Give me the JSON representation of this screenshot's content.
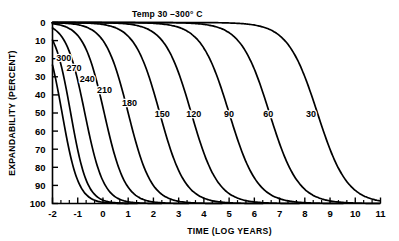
{
  "chart_data": {
    "type": "line",
    "title": "Temp 30 –300° C",
    "xlabel": "TIME (LOG YEARS)",
    "ylabel": "EXPANDABILITY (PERCENT)",
    "xlim": [
      -2,
      11
    ],
    "ylim": [
      0,
      100
    ],
    "y_inverted": true,
    "grid": false,
    "legend": "inline-curve-labels",
    "xticks": [
      -2,
      -1,
      0,
      1,
      2,
      3,
      4,
      5,
      6,
      7,
      8,
      9,
      10,
      11
    ],
    "xtick_labels": [
      "-2",
      "-1",
      "0",
      "1",
      "2",
      "3",
      "4",
      "5",
      "6",
      "7",
      "8",
      "9",
      "10",
      "11"
    ],
    "x_minor_ticks_per_interval": 2,
    "yticks": [
      0,
      10,
      20,
      30,
      40,
      50,
      60,
      70,
      80,
      90,
      100
    ],
    "ytick_labels": [
      "0",
      "10",
      "20",
      "30",
      "40",
      "50",
      "60",
      "70",
      "80",
      "90",
      "100"
    ],
    "series": [
      {
        "name": "300",
        "label": "300",
        "label_x": -1.55,
        "label_y": 21,
        "midpoint_x": -1.62,
        "slope": 1.55,
        "points": [
          {
            "x": -2.0,
            "y": 57.0
          },
          {
            "x": -1.9,
            "y": 68.0
          },
          {
            "x": -1.8,
            "y": 78.0
          },
          {
            "x": -1.7,
            "y": 86.5
          },
          {
            "x": -1.6,
            "y": 92.5
          },
          {
            "x": -1.5,
            "y": 96.2
          },
          {
            "x": -1.4,
            "y": 98.3
          },
          {
            "x": -1.3,
            "y": 99.3
          },
          {
            "x": -1.2,
            "y": 99.8
          },
          {
            "x": -1.1,
            "y": 100.0
          }
        ]
      },
      {
        "name": "270",
        "label": "270",
        "label_x": -1.15,
        "label_y": 27,
        "midpoint_x": -1.28,
        "slope": 1.55,
        "points": [
          {
            "x": -2.0,
            "y": 24.0
          },
          {
            "x": -1.8,
            "y": 40.0
          },
          {
            "x": -1.6,
            "y": 58.0
          },
          {
            "x": -1.4,
            "y": 74.0
          },
          {
            "x": -1.2,
            "y": 86.0
          },
          {
            "x": -1.0,
            "y": 93.5
          },
          {
            "x": -0.8,
            "y": 97.3
          },
          {
            "x": -0.6,
            "y": 99.1
          },
          {
            "x": -0.4,
            "y": 99.8
          },
          {
            "x": -0.2,
            "y": 100.0
          }
        ]
      },
      {
        "name": "240",
        "label": "240",
        "label_x": -0.62,
        "label_y": 33,
        "midpoint_x": -0.72,
        "slope": 1.35,
        "points": [
          {
            "x": -2.0,
            "y": 13.0
          },
          {
            "x": -1.7,
            "y": 23.0
          },
          {
            "x": -1.4,
            "y": 37.0
          },
          {
            "x": -1.1,
            "y": 53.0
          },
          {
            "x": -0.8,
            "y": 69.0
          },
          {
            "x": -0.5,
            "y": 81.5
          },
          {
            "x": -0.2,
            "y": 90.5
          },
          {
            "x": 0.1,
            "y": 95.6
          },
          {
            "x": 0.4,
            "y": 98.2
          },
          {
            "x": 0.7,
            "y": 99.4
          },
          {
            "x": 1.0,
            "y": 99.9
          }
        ]
      },
      {
        "name": "210",
        "label": "210",
        "label_x": 0.06,
        "label_y": 39,
        "midpoint_x": 0.05,
        "slope": 1.22,
        "points": [
          {
            "x": -2.0,
            "y": 7.0
          },
          {
            "x": -1.6,
            "y": 12.0
          },
          {
            "x": -1.2,
            "y": 19.5
          },
          {
            "x": -0.8,
            "y": 30.0
          },
          {
            "x": -0.4,
            "y": 43.0
          },
          {
            "x": 0.0,
            "y": 57.0
          },
          {
            "x": 0.4,
            "y": 70.5
          },
          {
            "x": 0.8,
            "y": 81.5
          },
          {
            "x": 1.2,
            "y": 89.5
          },
          {
            "x": 1.6,
            "y": 94.7
          },
          {
            "x": 2.0,
            "y": 97.6
          },
          {
            "x": 2.4,
            "y": 99.0
          },
          {
            "x": 2.8,
            "y": 99.7
          }
        ]
      },
      {
        "name": "180",
        "label": "180",
        "label_x": 1.05,
        "label_y": 46,
        "midpoint_x": 1.0,
        "slope": 1.1,
        "points": [
          {
            "x": -2.0,
            "y": 3.5
          },
          {
            "x": -1.5,
            "y": 5.8
          },
          {
            "x": -1.0,
            "y": 9.5
          },
          {
            "x": -0.5,
            "y": 15.0
          },
          {
            "x": 0.0,
            "y": 23.0
          },
          {
            "x": 0.5,
            "y": 34.0
          },
          {
            "x": 1.0,
            "y": 47.5
          },
          {
            "x": 1.5,
            "y": 61.5
          },
          {
            "x": 2.0,
            "y": 74.0
          },
          {
            "x": 2.5,
            "y": 84.0
          },
          {
            "x": 3.0,
            "y": 91.0
          },
          {
            "x": 3.5,
            "y": 95.3
          },
          {
            "x": 4.0,
            "y": 97.8
          },
          {
            "x": 4.5,
            "y": 99.1
          }
        ]
      },
      {
        "name": "150",
        "label": "150",
        "label_x": 2.35,
        "label_y": 52,
        "midpoint_x": 2.25,
        "slope": 1.0,
        "points": [
          {
            "x": -2.0,
            "y": 1.5
          },
          {
            "x": -1.2,
            "y": 3.0
          },
          {
            "x": -0.4,
            "y": 6.0
          },
          {
            "x": 0.4,
            "y": 11.5
          },
          {
            "x": 1.0,
            "y": 18.5
          },
          {
            "x": 1.6,
            "y": 29.0
          },
          {
            "x": 2.2,
            "y": 42.5
          },
          {
            "x": 2.8,
            "y": 57.5
          },
          {
            "x": 3.4,
            "y": 71.0
          },
          {
            "x": 4.0,
            "y": 82.0
          },
          {
            "x": 4.6,
            "y": 89.5
          },
          {
            "x": 5.2,
            "y": 94.4
          },
          {
            "x": 5.8,
            "y": 97.2
          },
          {
            "x": 6.4,
            "y": 98.8
          }
        ]
      },
      {
        "name": "120",
        "label": "120",
        "label_x": 3.6,
        "label_y": 52,
        "midpoint_x": 3.5,
        "slope": 0.95,
        "points": [
          {
            "x": -2.0,
            "y": 0.8
          },
          {
            "x": -0.8,
            "y": 2.0
          },
          {
            "x": 0.4,
            "y": 4.5
          },
          {
            "x": 1.4,
            "y": 8.5
          },
          {
            "x": 2.2,
            "y": 14.5
          },
          {
            "x": 2.9,
            "y": 23.5
          },
          {
            "x": 3.5,
            "y": 34.5
          },
          {
            "x": 4.1,
            "y": 48.0
          },
          {
            "x": 4.7,
            "y": 62.0
          },
          {
            "x": 5.3,
            "y": 74.5
          },
          {
            "x": 5.9,
            "y": 84.5
          },
          {
            "x": 6.5,
            "y": 91.0
          },
          {
            "x": 7.1,
            "y": 95.2
          },
          {
            "x": 7.7,
            "y": 97.6
          }
        ]
      },
      {
        "name": "90",
        "label": "90",
        "label_x": 5.0,
        "label_y": 52,
        "midpoint_x": 5.0,
        "slope": 0.9,
        "points": [
          {
            "x": -2.0,
            "y": 0.5
          },
          {
            "x": 0.0,
            "y": 1.4
          },
          {
            "x": 1.6,
            "y": 3.0
          },
          {
            "x": 2.8,
            "y": 5.5
          },
          {
            "x": 3.8,
            "y": 9.5
          },
          {
            "x": 4.6,
            "y": 15.5
          },
          {
            "x": 5.3,
            "y": 24.5
          },
          {
            "x": 5.9,
            "y": 35.0
          },
          {
            "x": 6.5,
            "y": 48.0
          },
          {
            "x": 7.1,
            "y": 61.5
          },
          {
            "x": 7.7,
            "y": 73.5
          },
          {
            "x": 8.3,
            "y": 83.5
          },
          {
            "x": 8.9,
            "y": 90.5
          },
          {
            "x": 9.5,
            "y": 94.9
          }
        ]
      },
      {
        "name": "60",
        "label": "60",
        "label_x": 6.55,
        "label_y": 52,
        "midpoint_x": 6.6,
        "slope": 0.88,
        "points": [
          {
            "x": -2.0,
            "y": 0.3
          },
          {
            "x": 1.0,
            "y": 1.0
          },
          {
            "x": 3.0,
            "y": 2.3
          },
          {
            "x": 4.4,
            "y": 4.4
          },
          {
            "x": 5.4,
            "y": 7.5
          },
          {
            "x": 6.2,
            "y": 12.0
          },
          {
            "x": 6.9,
            "y": 19.5
          },
          {
            "x": 7.6,
            "y": 30.5
          },
          {
            "x": 8.2,
            "y": 42.5
          },
          {
            "x": 8.8,
            "y": 56.0
          },
          {
            "x": 9.4,
            "y": 68.5
          },
          {
            "x": 10.0,
            "y": 79.5
          },
          {
            "x": 10.6,
            "y": 87.5
          },
          {
            "x": 11.0,
            "y": 91.5
          }
        ]
      },
      {
        "name": "30",
        "label": "30",
        "label_x": 8.25,
        "label_y": 52,
        "midpoint_x": 8.5,
        "slope": 0.85,
        "points": [
          {
            "x": -2.0,
            "y": 0.2
          },
          {
            "x": 2.0,
            "y": 0.8
          },
          {
            "x": 4.5,
            "y": 1.8
          },
          {
            "x": 6.0,
            "y": 3.3
          },
          {
            "x": 7.0,
            "y": 5.5
          },
          {
            "x": 7.8,
            "y": 8.8
          },
          {
            "x": 8.5,
            "y": 14.0
          },
          {
            "x": 9.2,
            "y": 21.5
          },
          {
            "x": 9.8,
            "y": 30.0
          },
          {
            "x": 10.4,
            "y": 40.0
          },
          {
            "x": 11.0,
            "y": 51.0
          }
        ]
      }
    ]
  }
}
